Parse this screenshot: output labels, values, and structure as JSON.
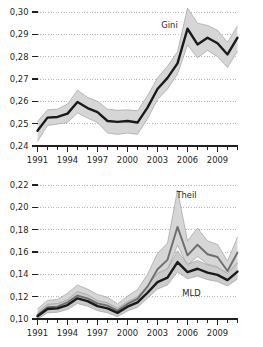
{
  "chart_data": [
    {
      "id": "gini",
      "type": "line",
      "title": "",
      "xlabel": "",
      "ylabel": "",
      "xlim": [
        1991,
        2011
      ],
      "ylim": [
        0.24,
        0.3
      ],
      "grid": true,
      "grid_style": "dotted-horizontal",
      "legend": "inline-annotation",
      "x": [
        1991,
        1992,
        1993,
        1994,
        1995,
        1996,
        1997,
        1998,
        1999,
        2000,
        2001,
        2002,
        2003,
        2004,
        2005,
        2006,
        2007,
        2008,
        2009,
        2010,
        2011
      ],
      "xtick_labels": [
        "1991",
        "1994",
        "1997",
        "2000",
        "2003",
        "2006",
        "2009"
      ],
      "xtick_values": [
        1991,
        1994,
        1997,
        2000,
        2003,
        2006,
        2009
      ],
      "ytick_labels": [
        "0,24",
        "0,25",
        "0,26",
        "0,27",
        "0,28",
        "0,29",
        "0,30"
      ],
      "ytick_values": [
        0.24,
        0.25,
        0.26,
        0.27,
        0.28,
        0.29,
        0.3
      ],
      "series": [
        {
          "name": "Gini",
          "color": "#1a1a1a",
          "values": [
            0.2468,
            0.2527,
            0.253,
            0.2545,
            0.2597,
            0.257,
            0.2552,
            0.2512,
            0.2508,
            0.2512,
            0.2505,
            0.2572,
            0.2655,
            0.2705,
            0.277,
            0.2925,
            0.2855,
            0.2885,
            0.286,
            0.281,
            0.2885
          ],
          "band_color": "#d4d4d4",
          "band_lower": [
            0.242,
            0.2492,
            0.2498,
            0.2505,
            0.2548,
            0.2525,
            0.2505,
            0.2458,
            0.2452,
            0.2458,
            0.2452,
            0.2522,
            0.2608,
            0.2655,
            0.2722,
            0.2852,
            0.2795,
            0.2828,
            0.28,
            0.2752,
            0.2825
          ],
          "band_upper": [
            0.251,
            0.2562,
            0.2565,
            0.2588,
            0.265,
            0.2618,
            0.26,
            0.2565,
            0.256,
            0.2562,
            0.2558,
            0.2625,
            0.2705,
            0.2758,
            0.2822,
            0.3018,
            0.295,
            0.294,
            0.2918,
            0.2865,
            0.2938
          ]
        }
      ],
      "annotations": [
        {
          "text": "Gini",
          "x": 2004.2,
          "y": 0.293
        }
      ]
    },
    {
      "id": "theil-mld",
      "type": "line",
      "title": "",
      "xlabel": "",
      "ylabel": "",
      "xlim": [
        1991,
        2011
      ],
      "ylim": [
        0.1,
        0.22
      ],
      "grid": true,
      "grid_style": "dotted-horizontal",
      "legend": "inline-annotation",
      "x": [
        1991,
        1992,
        1993,
        1994,
        1995,
        1996,
        1997,
        1998,
        1999,
        2000,
        2001,
        2002,
        2003,
        2004,
        2005,
        2006,
        2007,
        2008,
        2009,
        2010,
        2011
      ],
      "xtick_labels": [
        "1991",
        "1994",
        "1997",
        "2000",
        "2003",
        "2006",
        "2009"
      ],
      "xtick_values": [
        1991,
        1994,
        1997,
        2000,
        2003,
        2006,
        2009
      ],
      "ytick_labels": [
        "0,10",
        "0,12",
        "0,14",
        "0,16",
        "0,18",
        "0,20",
        "0,22"
      ],
      "ytick_values": [
        0.1,
        0.12,
        0.14,
        0.16,
        0.18,
        0.2,
        0.22
      ],
      "series": [
        {
          "name": "Theil",
          "color": "#6e6e6e",
          "values": [
            0.1035,
            0.1105,
            0.111,
            0.115,
            0.121,
            0.1185,
            0.114,
            0.112,
            0.1075,
            0.1135,
            0.118,
            0.129,
            0.1445,
            0.153,
            0.1825,
            0.157,
            0.1665,
            0.158,
            0.1555,
            0.143,
            0.1595
          ],
          "band_color": "#d4d4d4",
          "band_lower": [
            0.1005,
            0.1062,
            0.107,
            0.11,
            0.115,
            0.113,
            0.109,
            0.1065,
            0.103,
            0.1085,
            0.1125,
            0.1225,
            0.136,
            0.144,
            0.166,
            0.148,
            0.156,
            0.149,
            0.1468,
            0.136,
            0.15
          ],
          "band_upper": [
            0.109,
            0.1168,
            0.1175,
            0.123,
            0.1305,
            0.1268,
            0.122,
            0.1195,
            0.1135,
            0.1205,
            0.1265,
            0.14,
            0.159,
            0.168,
            0.2155,
            0.17,
            0.1815,
            0.17,
            0.1668,
            0.152,
            0.1735
          ]
        },
        {
          "name": "MLD",
          "color": "#1a1a1a",
          "values": [
            0.1025,
            0.109,
            0.1095,
            0.1125,
            0.1185,
            0.116,
            0.1115,
            0.1095,
            0.1055,
            0.111,
            0.1148,
            0.1235,
            0.133,
            0.137,
            0.151,
            0.142,
            0.145,
            0.1415,
            0.1395,
            0.1348,
            0.1425
          ],
          "band_color": "#c9c9c9",
          "band_lower": [
            0.1,
            0.1055,
            0.106,
            0.1085,
            0.1138,
            0.1115,
            0.1075,
            0.1055,
            0.102,
            0.1072,
            0.1105,
            0.1185,
            0.1268,
            0.1305,
            0.142,
            0.136,
            0.1385,
            0.1352,
            0.1335,
            0.1295,
            0.1358
          ],
          "band_upper": [
            0.1058,
            0.1132,
            0.1138,
            0.1175,
            0.1245,
            0.1218,
            0.1165,
            0.1145,
            0.1098,
            0.1155,
            0.12,
            0.1298,
            0.1408,
            0.145,
            0.1612,
            0.149,
            0.1525,
            0.1485,
            0.1462,
            0.1408,
            0.1505
          ]
        }
      ],
      "annotations": [
        {
          "text": "Theil",
          "x": 2005.9,
          "y": 0.2085
        },
        {
          "text": "MLD",
          "x": 2006.4,
          "y": 0.1205
        }
      ]
    }
  ],
  "colors": {
    "line_dark": "#1a1a1a",
    "line_gray": "#6e6e6e",
    "band": "#d4d4d4",
    "band_inner": "#c9c9c9",
    "axis": "#231f20",
    "grid": "#9a9a9a",
    "background": "#ffffff"
  }
}
